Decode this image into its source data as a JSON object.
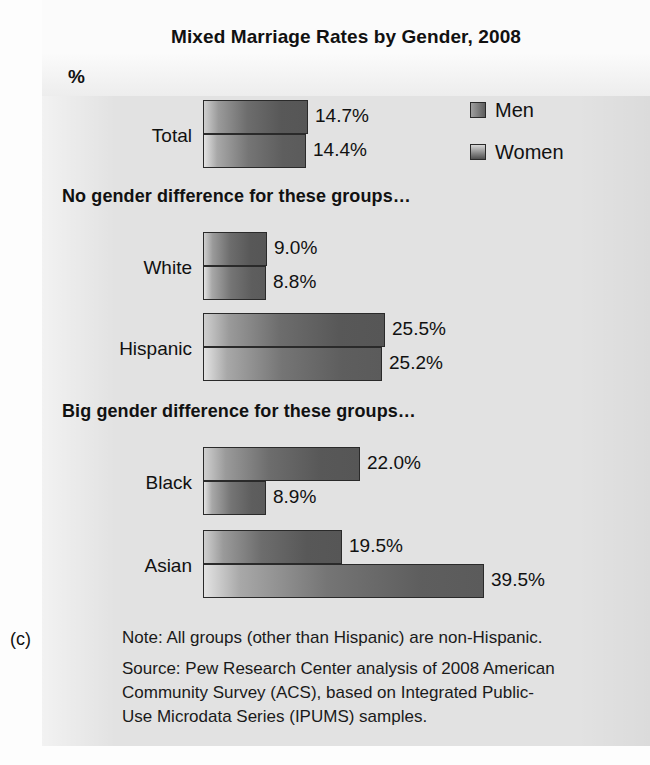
{
  "figure": {
    "letter": "(c)",
    "title": "Mixed Marriage Rates by Gender, 2008",
    "axis_unit_label": "%"
  },
  "legend": {
    "position": "top-right",
    "entries": [
      {
        "label": "Men",
        "swatch": "men-swatch"
      },
      {
        "label": "Women",
        "swatch": "women-swatch"
      }
    ]
  },
  "sections": [
    {
      "heading": "No gender difference for these groups…"
    },
    {
      "heading": "Big gender difference for these groups…"
    }
  ],
  "groups": [
    {
      "label": "Total",
      "men": "14.7%",
      "women": "14.4%"
    },
    {
      "label": "White",
      "men": "9.0%",
      "women": "8.8%"
    },
    {
      "label": "Hispanic",
      "men": "25.5%",
      "women": "25.2%"
    },
    {
      "label": "Black",
      "men": "22.0%",
      "women": "8.9%"
    },
    {
      "label": "Asian",
      "men": "19.5%",
      "women": "39.5%"
    }
  ],
  "footnotes": {
    "note_line_1": "Note: All groups (other than Hispanic) are non-Hispanic.",
    "source_line_1": "Source: Pew Research Center analysis of 2008 American",
    "source_line_2": "Community Survey (ACS), based on Integrated Public-",
    "source_line_3": "Use Microdata Series (IPUMS) samples."
  },
  "colors": {
    "panel_background": "#e2e2e2",
    "bar_outline": "#2a2a2a",
    "bar_gradient_light": "#cfcfcf",
    "bar_gradient_dark": "#565656",
    "text": "#111111"
  },
  "chart_data": {
    "type": "bar",
    "orientation": "horizontal",
    "title": "Mixed Marriage Rates by Gender, 2008",
    "xlabel": "%",
    "ylabel": "",
    "xlim": [
      0,
      40
    ],
    "grid": false,
    "legend_position": "top-right",
    "categories": [
      "Total",
      "White",
      "Hispanic",
      "Black",
      "Asian"
    ],
    "series": [
      {
        "name": "Men",
        "values": [
          14.7,
          9.0,
          25.5,
          22.0,
          19.5
        ]
      },
      {
        "name": "Women",
        "values": [
          14.4,
          8.8,
          25.2,
          8.9,
          39.5
        ]
      }
    ],
    "data_labels": [
      {
        "category": "Total",
        "Men": "14.7%",
        "Women": "14.4%"
      },
      {
        "category": "White",
        "Men": "9.0%",
        "Women": "8.8%"
      },
      {
        "category": "Hispanic",
        "Men": "25.5%",
        "Women": "25.2%"
      },
      {
        "category": "Black",
        "Men": "22.0%",
        "Women": "8.9%"
      },
      {
        "category": "Asian",
        "Men": "19.5%",
        "Women": "39.5%"
      }
    ],
    "annotations": [
      {
        "text": "No gender difference for these groups…",
        "applies_to": [
          "White",
          "Hispanic"
        ]
      },
      {
        "text": "Big gender difference for these groups…",
        "applies_to": [
          "Black",
          "Asian"
        ]
      }
    ],
    "note": "Note: All groups (other than Hispanic) are non-Hispanic.",
    "source": "Source: Pew Research Center analysis of 2008 American Community Survey (ACS), based on Integrated Public-Use Microdata Series (IPUMS) samples."
  },
  "layout": {
    "bar_origin_x": 203,
    "px_per_percent": 7.12,
    "bar_height": 34,
    "rows": [
      {
        "group": 0,
        "men_top": 100,
        "women_top": 134
      },
      {
        "group": 1,
        "men_top": 232,
        "women_top": 266
      },
      {
        "group": 2,
        "men_top": 313,
        "women_top": 347
      },
      {
        "group": 3,
        "men_top": 447,
        "women_top": 481
      },
      {
        "group": 4,
        "men_top": 530,
        "women_top": 564
      }
    ]
  }
}
